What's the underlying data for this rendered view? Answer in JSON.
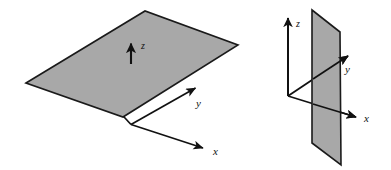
{
  "figure": {
    "name": "coordinate-plane-orientation-figure",
    "background_color": "#ffffff",
    "width": 391,
    "height": 170,
    "plane_fill_color": "#a8a8a8",
    "outline_color": "#1a1a1a",
    "axis_color": "#111111"
  },
  "diagrams": [
    {
      "id": "horizontal-plane-diagram",
      "description": "Shaded horizontal plane (xy-plane) drawn in perspective with z axis pointing up",
      "plane": {
        "orientation": "horizontal",
        "fill": "#a8a8a8",
        "corners": [
          {
            "x": 26,
            "y": 83
          },
          {
            "x": 145,
            "y": 11
          },
          {
            "x": 238,
            "y": 45
          },
          {
            "x": 123,
            "y": 117
          }
        ]
      },
      "origin": {
        "x": 131,
        "y": 124
      },
      "axes": [
        {
          "name": "z",
          "label": "z",
          "label_pos": {
            "x": 141,
            "y": 49
          },
          "start": {
            "x": 131,
            "y": 64
          },
          "end": {
            "x": 131,
            "y": 41
          }
        },
        {
          "name": "y",
          "label": "y",
          "label_pos": {
            "x": 196,
            "y": 107
          },
          "start": {
            "x": 131,
            "y": 124
          },
          "end": {
            "x": 198,
            "y": 86
          }
        },
        {
          "name": "x",
          "label": "x",
          "label_pos": {
            "x": 213,
            "y": 155
          },
          "start": {
            "x": 131,
            "y": 124
          },
          "end": {
            "x": 206,
            "y": 149
          }
        }
      ],
      "drop_line": {
        "from": {
          "x": 123,
          "y": 117
        },
        "to": {
          "x": 131,
          "y": 124
        }
      }
    },
    {
      "id": "vertical-plane-diagram",
      "description": "Shaded vertical plane (yz-plane) drawn in perspective with z axis up, y and x axes to the right",
      "plane": {
        "orientation": "vertical",
        "fill": "#a8a8a8",
        "corners": [
          {
            "x": 312,
            "y": 10
          },
          {
            "x": 340,
            "y": 32
          },
          {
            "x": 341,
            "y": 165
          },
          {
            "x": 312,
            "y": 143
          }
        ]
      },
      "origin": {
        "x": 288,
        "y": 96
      },
      "axes": [
        {
          "name": "z",
          "label": "z",
          "label_pos": {
            "x": 296,
            "y": 27
          },
          "start": {
            "x": 288,
            "y": 96
          },
          "end": {
            "x": 288,
            "y": 15
          }
        },
        {
          "name": "y",
          "label": "y",
          "label_pos": {
            "x": 345,
            "y": 72
          },
          "start": {
            "x": 288,
            "y": 96
          },
          "end": {
            "x": 351,
            "y": 54
          }
        },
        {
          "name": "x",
          "label": "x",
          "label_pos": {
            "x": 364,
            "y": 121
          },
          "start": {
            "x": 288,
            "y": 96
          },
          "end": {
            "x": 359,
            "y": 118
          }
        }
      ]
    }
  ]
}
